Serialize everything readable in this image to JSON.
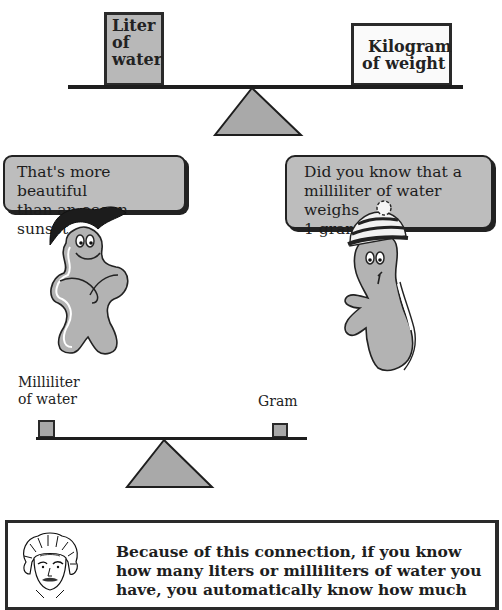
{
  "top_scale": {
    "left_box": {
      "lines": [
        "Liter",
        "of",
        "water"
      ]
    },
    "right_box": {
      "lines": [
        "Kilogram",
        "of weight"
      ]
    }
  },
  "characters": {
    "left": {
      "speech": [
        "That's more beautiful",
        "than an ocean sunset."
      ],
      "hat": "black-cap"
    },
    "right": {
      "speech": [
        "Did you know that a",
        "milliliter of water weighs",
        "1 gram."
      ],
      "hat": "striped-beanie"
    }
  },
  "bottom_scale": {
    "left_label": [
      "Milliliter",
      "of water"
    ],
    "right_label": "Gram"
  },
  "note": {
    "icon": "scientist-portrait",
    "lines": [
      "Because of this connection, if you know",
      "how many liters or milliliters of water you",
      "have, you automatically know how much"
    ]
  },
  "colors": {
    "fill_gray": "#b8b8b8",
    "outline": "#1e1e1e",
    "background": "#ffffff"
  }
}
